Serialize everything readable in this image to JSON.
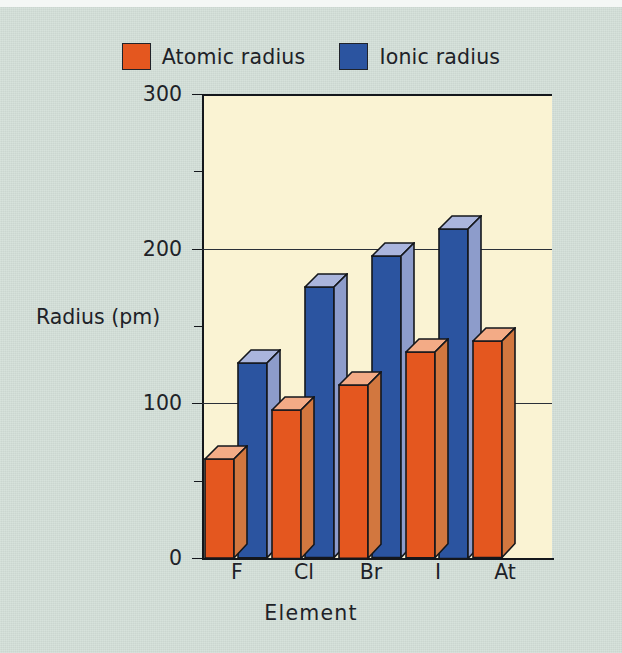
{
  "legend": {
    "items": [
      {
        "label": "Atomic radius",
        "color": "#e4571f",
        "icon": "orange-square-swatch"
      },
      {
        "label": "Ionic radius",
        "color": "#2b54a0",
        "icon": "blue-square-swatch"
      }
    ]
  },
  "axes": {
    "y_title": "Radius (pm)",
    "x_title": "Element",
    "y_major_ticks": [
      "300",
      "200",
      "100",
      "0"
    ],
    "y_minor_ticks": [
      "250",
      "150",
      "50"
    ]
  },
  "colors": {
    "page_background": "#cfdcd4",
    "plot_background": "#faf3d3",
    "atomic_radius": "#e4571f",
    "atomic_radius_top": "#f3ab86",
    "atomic_radius_side": "#d2773f",
    "ionic_radius": "#2b54a0",
    "ionic_radius_top": "#aab5dd",
    "ionic_radius_side": "#8d9ccb",
    "axis_line": "#14171c",
    "text": "#1e2228"
  },
  "chart_data": {
    "type": "bar",
    "title": "",
    "xlabel": "Element",
    "ylabel": "Radius (pm)",
    "ylim": [
      0,
      300
    ],
    "ytick_values": [
      0,
      100,
      200,
      300
    ],
    "yminor_tick_values": [
      50,
      150,
      250
    ],
    "grid": true,
    "legend_position": "top-center",
    "style": "3d-columns",
    "categories": [
      "F",
      "Cl",
      "Br",
      "I",
      "At"
    ],
    "series": [
      {
        "name": "Atomic radius",
        "color": "#e4571f",
        "values": [
          64,
          96,
          112,
          133,
          140
        ]
      },
      {
        "name": "Ionic radius",
        "color": "#2b54a0",
        "values": [
          126,
          175,
          195,
          213,
          null
        ]
      }
    ]
  }
}
